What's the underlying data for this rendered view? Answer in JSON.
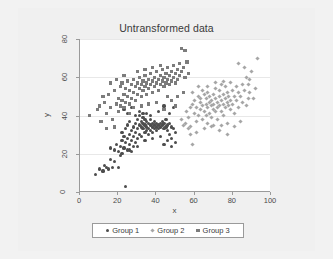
{
  "chart_data": {
    "type": "scatter",
    "title": "Untransformed data",
    "xlabel": "x",
    "ylabel": "y",
    "xlim": [
      0,
      100
    ],
    "ylim": [
      0,
      80
    ],
    "xticks": [
      0,
      20,
      40,
      60,
      80,
      100
    ],
    "yticks": [
      0,
      20,
      40,
      60,
      80
    ],
    "grid": "horizontal",
    "legend_position": "bottom",
    "colors": {
      "group1": "#4d4d4d",
      "group2": "#a6a6a6",
      "group3": "#7c7c7c",
      "plot_background": "#ffffff",
      "canvas_background": "#f0f0f0",
      "gridline": "#e8e8e8",
      "axis": "#9a9a9a"
    },
    "series": [
      {
        "name": "Group 1",
        "marker": "circle",
        "color": "#4d4d4d",
        "points": [
          [
            8,
            9
          ],
          [
            10,
            12
          ],
          [
            13,
            14
          ],
          [
            15,
            12
          ],
          [
            16,
            17
          ],
          [
            17,
            13
          ],
          [
            18,
            22
          ],
          [
            19,
            25
          ],
          [
            20,
            21
          ],
          [
            21,
            24
          ],
          [
            21,
            19
          ],
          [
            22,
            27
          ],
          [
            22,
            31
          ],
          [
            23,
            23
          ],
          [
            23,
            29
          ],
          [
            24,
            3
          ],
          [
            24,
            26
          ],
          [
            24,
            33
          ],
          [
            25,
            22
          ],
          [
            25,
            28
          ],
          [
            25,
            35
          ],
          [
            26,
            30
          ],
          [
            26,
            25
          ],
          [
            26,
            37
          ],
          [
            27,
            32
          ],
          [
            27,
            27
          ],
          [
            27,
            21
          ],
          [
            28,
            34
          ],
          [
            28,
            29
          ],
          [
            28,
            24
          ],
          [
            29,
            36
          ],
          [
            29,
            31
          ],
          [
            29,
            26
          ],
          [
            30,
            33
          ],
          [
            30,
            38
          ],
          [
            30,
            28
          ],
          [
            31,
            35
          ],
          [
            31,
            30
          ],
          [
            31,
            40
          ],
          [
            32,
            34
          ],
          [
            32,
            37
          ],
          [
            32,
            29
          ],
          [
            33,
            33
          ],
          [
            33,
            36
          ],
          [
            33,
            39
          ],
          [
            34,
            31
          ],
          [
            34,
            35
          ],
          [
            34,
            38
          ],
          [
            35,
            34
          ],
          [
            35,
            32
          ],
          [
            35,
            37
          ],
          [
            36,
            36
          ],
          [
            36,
            33
          ],
          [
            36,
            30
          ],
          [
            37,
            35
          ],
          [
            37,
            38
          ],
          [
            37,
            32
          ],
          [
            38,
            34
          ],
          [
            38,
            36
          ],
          [
            38,
            31
          ],
          [
            39,
            35
          ],
          [
            39,
            33
          ],
          [
            39,
            37
          ],
          [
            40,
            34
          ],
          [
            40,
            36
          ],
          [
            40,
            32
          ],
          [
            41,
            35
          ],
          [
            41,
            33
          ],
          [
            42,
            36
          ],
          [
            42,
            34
          ],
          [
            43,
            35
          ],
          [
            43,
            37
          ],
          [
            44,
            33
          ],
          [
            44,
            36
          ],
          [
            45,
            34
          ],
          [
            45,
            38
          ],
          [
            46,
            35
          ],
          [
            46,
            32
          ],
          [
            47,
            36
          ],
          [
            47,
            30
          ],
          [
            48,
            34
          ],
          [
            48,
            28
          ],
          [
            49,
            33
          ],
          [
            50,
            31
          ],
          [
            14,
            13
          ],
          [
            16,
            23
          ],
          [
            18,
            16
          ],
          [
            20,
            13
          ],
          [
            22,
            20
          ],
          [
            12,
            11
          ],
          [
            26,
            22
          ],
          [
            30,
            24
          ],
          [
            34,
            27
          ],
          [
            38,
            28
          ],
          [
            42,
            29
          ],
          [
            44,
            25
          ],
          [
            46,
            27
          ],
          [
            48,
            24
          ],
          [
            50,
            26
          ],
          [
            23,
            43
          ],
          [
            27,
            44
          ],
          [
            31,
            42
          ],
          [
            35,
            41
          ],
          [
            44,
            45
          ],
          [
            47,
            41
          ],
          [
            49,
            44
          ],
          [
            41,
            42
          ],
          [
            37,
            40
          ],
          [
            33,
            41
          ],
          [
            29,
            40
          ],
          [
            25,
            41
          ]
        ]
      },
      {
        "name": "Group 2",
        "marker": "diamond",
        "color": "#a6a6a6",
        "points": [
          [
            53,
            38
          ],
          [
            55,
            36
          ],
          [
            56,
            42
          ],
          [
            57,
            39
          ],
          [
            58,
            44
          ],
          [
            58,
            34
          ],
          [
            59,
            46
          ],
          [
            59,
            25
          ],
          [
            60,
            41
          ],
          [
            60,
            48
          ],
          [
            61,
            37
          ],
          [
            61,
            44
          ],
          [
            62,
            50
          ],
          [
            62,
            40
          ],
          [
            63,
            43
          ],
          [
            63,
            47
          ],
          [
            64,
            38
          ],
          [
            64,
            45
          ],
          [
            65,
            51
          ],
          [
            65,
            42
          ],
          [
            66,
            46
          ],
          [
            66,
            40
          ],
          [
            66,
            49
          ],
          [
            67,
            44
          ],
          [
            67,
            36
          ],
          [
            67,
            52
          ],
          [
            68,
            47
          ],
          [
            68,
            41
          ],
          [
            68,
            50
          ],
          [
            69,
            45
          ],
          [
            69,
            39
          ],
          [
            69,
            48
          ],
          [
            70,
            43
          ],
          [
            70,
            51
          ],
          [
            70,
            46
          ],
          [
            71,
            49
          ],
          [
            71,
            42
          ],
          [
            71,
            54
          ],
          [
            72,
            47
          ],
          [
            72,
            44
          ],
          [
            72,
            38
          ],
          [
            73,
            50
          ],
          [
            73,
            45
          ],
          [
            73,
            53
          ],
          [
            74,
            48
          ],
          [
            74,
            42
          ],
          [
            74,
            56
          ],
          [
            75,
            46
          ],
          [
            75,
            51
          ],
          [
            75,
            40
          ],
          [
            76,
            49
          ],
          [
            76,
            44
          ],
          [
            76,
            55
          ],
          [
            77,
            47
          ],
          [
            77,
            52
          ],
          [
            77,
            36
          ],
          [
            78,
            45
          ],
          [
            78,
            50
          ],
          [
            79,
            48
          ],
          [
            79,
            43
          ],
          [
            80,
            53
          ],
          [
            80,
            46
          ],
          [
            81,
            50
          ],
          [
            81,
            41
          ],
          [
            82,
            55
          ],
          [
            82,
            48
          ],
          [
            83,
            52
          ],
          [
            83,
            44
          ],
          [
            84,
            37
          ],
          [
            84,
            50
          ],
          [
            85,
            56
          ],
          [
            85,
            47
          ],
          [
            86,
            53
          ],
          [
            87,
            45
          ],
          [
            87,
            60
          ],
          [
            88,
            49
          ],
          [
            88,
            56
          ],
          [
            89,
            52
          ],
          [
            90,
            63
          ],
          [
            91,
            49
          ],
          [
            92,
            54
          ],
          [
            93,
            70
          ],
          [
            86,
            65
          ],
          [
            83,
            67
          ],
          [
            89,
            59
          ],
          [
            79,
            57
          ],
          [
            75,
            58
          ],
          [
            71,
            57
          ],
          [
            62,
            55
          ],
          [
            64,
            53
          ],
          [
            58,
            30
          ],
          [
            61,
            31
          ],
          [
            65,
            33
          ],
          [
            69,
            34
          ],
          [
            73,
            32
          ],
          [
            77,
            30
          ],
          [
            81,
            34
          ],
          [
            57,
            33
          ],
          [
            54,
            35
          ],
          [
            59,
            52
          ],
          [
            63,
            49
          ],
          [
            67,
            55
          ],
          [
            70,
            35
          ],
          [
            74,
            35
          ]
        ]
      },
      {
        "name": "Group 3",
        "marker": "square",
        "color": "#7c7c7c",
        "points": [
          [
            5,
            40
          ],
          [
            9,
            43
          ],
          [
            11,
            37
          ],
          [
            13,
            47
          ],
          [
            14,
            41
          ],
          [
            15,
            51
          ],
          [
            16,
            44
          ],
          [
            17,
            38
          ],
          [
            18,
            53
          ],
          [
            19,
            46
          ],
          [
            20,
            49
          ],
          [
            20,
            42
          ],
          [
            21,
            55
          ],
          [
            21,
            45
          ],
          [
            22,
            57
          ],
          [
            22,
            48
          ],
          [
            23,
            51
          ],
          [
            23,
            44
          ],
          [
            24,
            54
          ],
          [
            24,
            47
          ],
          [
            25,
            58
          ],
          [
            25,
            50
          ],
          [
            26,
            53
          ],
          [
            26,
            46
          ],
          [
            27,
            56
          ],
          [
            27,
            49
          ],
          [
            28,
            59
          ],
          [
            28,
            52
          ],
          [
            29,
            55
          ],
          [
            29,
            48
          ],
          [
            30,
            57
          ],
          [
            30,
            51
          ],
          [
            31,
            54
          ],
          [
            31,
            60
          ],
          [
            32,
            56
          ],
          [
            32,
            50
          ],
          [
            33,
            58
          ],
          [
            33,
            53
          ],
          [
            34,
            61
          ],
          [
            34,
            55
          ],
          [
            35,
            57
          ],
          [
            35,
            51
          ],
          [
            36,
            59
          ],
          [
            36,
            54
          ],
          [
            37,
            62
          ],
          [
            37,
            56
          ],
          [
            38,
            58
          ],
          [
            38,
            52
          ],
          [
            39,
            60
          ],
          [
            39,
            55
          ],
          [
            40,
            63
          ],
          [
            40,
            57
          ],
          [
            41,
            59
          ],
          [
            41,
            53
          ],
          [
            42,
            61
          ],
          [
            42,
            56
          ],
          [
            43,
            64
          ],
          [
            43,
            58
          ],
          [
            44,
            60
          ],
          [
            44,
            55
          ],
          [
            45,
            62
          ],
          [
            45,
            57
          ],
          [
            46,
            65
          ],
          [
            46,
            59
          ],
          [
            47,
            61
          ],
          [
            47,
            56
          ],
          [
            48,
            63
          ],
          [
            48,
            58
          ],
          [
            49,
            66
          ],
          [
            49,
            60
          ],
          [
            50,
            62
          ],
          [
            50,
            57
          ],
          [
            51,
            64
          ],
          [
            51,
            59
          ],
          [
            52,
            67
          ],
          [
            52,
            61
          ],
          [
            53,
            75
          ],
          [
            53,
            63
          ],
          [
            54,
            65
          ],
          [
            55,
            74
          ],
          [
            55,
            60
          ],
          [
            56,
            68
          ],
          [
            57,
            62
          ],
          [
            12,
            50
          ],
          [
            16,
            57
          ],
          [
            19,
            59
          ],
          [
            23,
            61
          ],
          [
            28,
            44
          ],
          [
            32,
            45
          ],
          [
            36,
            46
          ],
          [
            40,
            47
          ],
          [
            44,
            43
          ],
          [
            48,
            48
          ],
          [
            51,
            50
          ],
          [
            54,
            52
          ],
          [
            30,
            63
          ],
          [
            34,
            64
          ],
          [
            38,
            65
          ],
          [
            42,
            66
          ],
          [
            46,
            50
          ],
          [
            50,
            45
          ],
          [
            26,
            41
          ],
          [
            18,
            34
          ],
          [
            14,
            33
          ],
          [
            10,
            45
          ]
        ]
      }
    ]
  },
  "axes": {
    "x_tick_labels": [
      "0",
      "20",
      "40",
      "60",
      "80",
      "100"
    ],
    "y_tick_labels": [
      "0",
      "20",
      "40",
      "60",
      "80"
    ]
  },
  "legend": {
    "items": [
      {
        "label": "Group 1",
        "marker": "circle"
      },
      {
        "label": "Group 2",
        "marker": "diamond"
      },
      {
        "label": "Group 3",
        "marker": "square"
      }
    ]
  }
}
